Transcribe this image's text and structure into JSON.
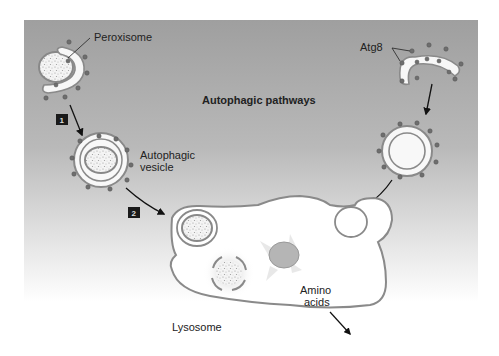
{
  "diagram": {
    "title": "Autophagic pathways",
    "labels": {
      "peroxisome": "Peroxisome",
      "atg8": "Atg8",
      "autophagic_vesicle_line1": "Autophagic",
      "autophagic_vesicle_line2": "vesicle",
      "lysosome": "Lysosome",
      "amino_acids_line1": "Amino",
      "amino_acids_line2": "acids"
    },
    "steps": [
      {
        "number": "1"
      },
      {
        "number": "2"
      }
    ],
    "colors": {
      "panel_top": "#9e9e9e",
      "panel_bottom": "#ffffff",
      "membrane": "#8a8a8a",
      "atg8_dot": "#6e6e6e",
      "step_box": "#1a1a1a"
    }
  }
}
